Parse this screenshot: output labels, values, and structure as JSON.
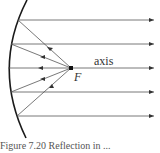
{
  "diagram": {
    "type": "concave mirror reflection from focus",
    "labels": {
      "axis": "axis",
      "focus": "F"
    },
    "caption": "Figure 7.20    Reflection in ...",
    "colors": {
      "mirror": "#1a1a1a",
      "rays": "#444444",
      "focus_dot": "#111111"
    },
    "focus_point": {
      "x": 71,
      "y": 68
    },
    "rays": [
      {
        "mirror_y": 20,
        "mirror_x": 18
      },
      {
        "mirror_y": 44,
        "mirror_x": 11
      },
      {
        "mirror_y": 68,
        "mirror_x": 8
      },
      {
        "mirror_y": 92,
        "mirror_x": 11
      },
      {
        "mirror_y": 116,
        "mirror_x": 17
      }
    ]
  }
}
